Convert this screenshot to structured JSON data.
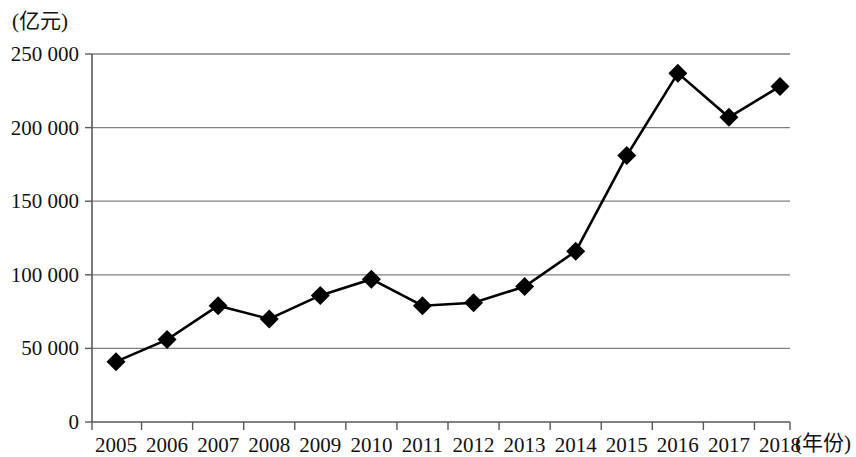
{
  "chart_data": {
    "type": "line",
    "title": "",
    "xlabel": "(年份)",
    "ylabel": "(亿元)",
    "unit_label": "(亿元)",
    "x_axis_name": "(年份)",
    "categories": [
      "2005",
      "2006",
      "2007",
      "2008",
      "2009",
      "2010",
      "2011",
      "2012",
      "2013",
      "2014",
      "2015",
      "2016",
      "2017",
      "2018"
    ],
    "values": [
      41000,
      56000,
      79000,
      70000,
      86000,
      97000,
      79000,
      81000,
      92000,
      116000,
      181000,
      237000,
      207000,
      228000
    ],
    "ylim": [
      0,
      250000
    ],
    "yticks": [
      0,
      50000,
      100000,
      150000,
      200000,
      250000
    ],
    "ytick_labels": [
      "0",
      "50 000",
      "100 000",
      "150 000",
      "200 000",
      "250 000"
    ],
    "grid": true,
    "grid_orientation": "horizontal",
    "legend": false,
    "marker": "diamond",
    "line_color": "#000000",
    "marker_color": "#000000",
    "grid_color": "#808080",
    "axis_color": "#595959",
    "background": "#ffffff"
  },
  "series_points": [
    {
      "year": "2005",
      "value": 41000
    },
    {
      "year": "2006",
      "value": 56000
    },
    {
      "year": "2007",
      "value": 79000
    },
    {
      "year": "2008",
      "value": 70000
    },
    {
      "year": "2009",
      "value": 86000
    },
    {
      "year": "2010",
      "value": 97000
    },
    {
      "year": "2011",
      "value": 79000
    },
    {
      "year": "2012",
      "value": 81000
    },
    {
      "year": "2013",
      "value": 92000
    },
    {
      "year": "2014",
      "value": 116000
    },
    {
      "year": "2015",
      "value": 181000
    },
    {
      "year": "2016",
      "value": 237000
    },
    {
      "year": "2017",
      "value": 207000
    },
    {
      "year": "2018",
      "value": 228000
    }
  ]
}
